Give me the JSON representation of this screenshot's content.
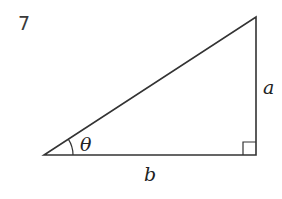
{
  "problem": {
    "number": "7"
  },
  "diagram": {
    "type": "right-triangle",
    "labels": {
      "opposite": "a",
      "adjacent": "b",
      "angle": "θ"
    },
    "colors": {
      "stroke": "#333333"
    }
  }
}
